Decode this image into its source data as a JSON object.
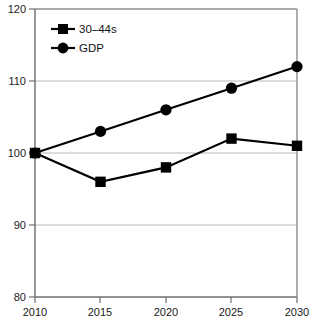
{
  "chart_data": {
    "type": "line",
    "title": "",
    "xlabel": "",
    "ylabel": "",
    "categories": [
      "2010",
      "2015",
      "2020",
      "2025",
      "2030"
    ],
    "x": [
      2010,
      2015,
      2020,
      2025,
      2030
    ],
    "xlim": [
      2010,
      2030
    ],
    "ylim": [
      80,
      120
    ],
    "yticks": [
      80,
      90,
      100,
      110,
      120
    ],
    "xticks": [
      2010,
      2015,
      2020,
      2025,
      2030
    ],
    "grid": "horizontal",
    "legend_position": "top-left",
    "series": [
      {
        "name": "30–44s",
        "marker": "square",
        "color": "#000000",
        "values": [
          100,
          96,
          98,
          102,
          101
        ]
      },
      {
        "name": "GDP",
        "marker": "circle",
        "color": "#000000",
        "values": [
          100,
          103,
          106,
          109,
          112
        ]
      }
    ]
  },
  "axis": {
    "y_tick_labels": [
      "120",
      "110",
      "100",
      "90",
      "80"
    ],
    "x_tick_labels": [
      "2010",
      "2015",
      "2020",
      "2025",
      "2030"
    ]
  },
  "legend": {
    "entries": [
      {
        "label": "30–44s",
        "marker": "square-marker-icon"
      },
      {
        "label": "GDP",
        "marker": "circle-marker-icon"
      }
    ]
  },
  "colors": {
    "series_line": "#000000",
    "grid": "#b9b9b9",
    "frame": "#8c8c8c",
    "background": "#ffffff"
  }
}
